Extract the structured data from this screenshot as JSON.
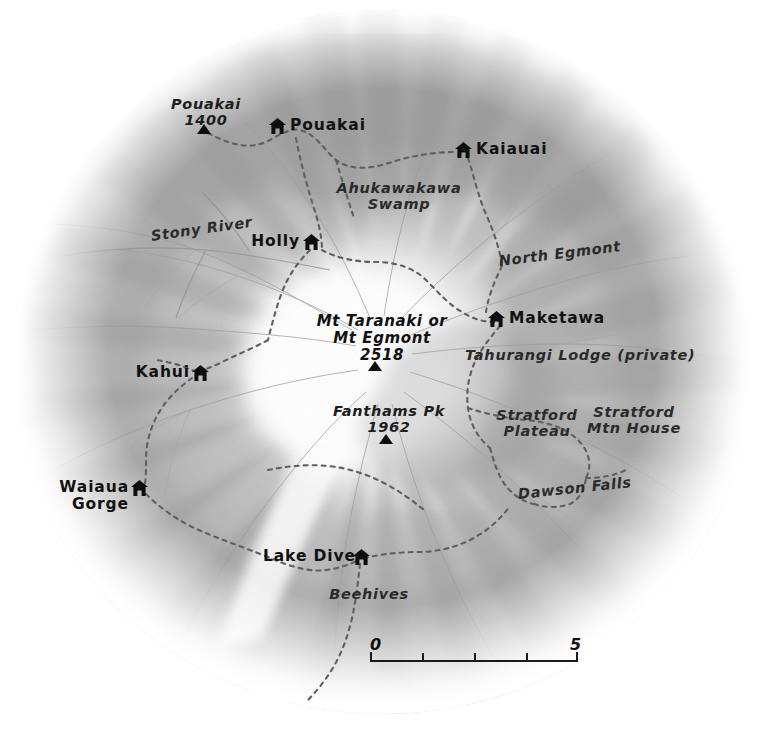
{
  "map": {
    "title": "Egmont National Park / Mt Taranaki shaded relief map",
    "colors": {
      "relief_dark": "#8d8d8d",
      "relief_mid": "#b4b4b4",
      "relief_light": "#dcdcdc",
      "background": "#ffffff",
      "track": "#6b6b6b",
      "stream": "#9a9a9a",
      "label": "#111111",
      "marker": "#0d0d0d"
    },
    "huts": [
      {
        "name": "Pouakai",
        "label_side": "right",
        "x": 277,
        "y": 126,
        "label_x": 295,
        "label_y": 126
      },
      {
        "name": "Kaiauai",
        "label_side": "right",
        "x": 463,
        "y": 150,
        "label_x": 481,
        "label_y": 150
      },
      {
        "name": "Holly",
        "label_side": "left",
        "x": 311,
        "y": 242,
        "label_x": 306,
        "label_y": 242
      },
      {
        "name": "Maketawa",
        "label_side": "right",
        "x": 496,
        "y": 319,
        "label_x": 514,
        "label_y": 319
      },
      {
        "name": "Kahui",
        "label_side": "left",
        "x": 199,
        "y": 373,
        "label_x": 194,
        "label_y": 373
      },
      {
        "name": "Waiaua Gorge",
        "label_side": "left",
        "x": 139,
        "y": 488,
        "label_x": 134,
        "label_y": 481
      },
      {
        "name": "Lake Dive",
        "label_side": "left",
        "x": 360,
        "y": 557,
        "label_x": 356,
        "label_y": 557
      }
    ],
    "summits": [
      {
        "name": "Pouakai",
        "elevation": "1400",
        "x": 204,
        "y": 127,
        "label_x": 206,
        "label_y": 96
      },
      {
        "name": "Mt Taranaki or\nMt Egmont",
        "elevation": "2518",
        "x": 375,
        "y": 364,
        "label_x": 382,
        "label_y": 313
      },
      {
        "name": "Fanthams Pk",
        "elevation": "1962",
        "x": 386,
        "y": 437,
        "label_x": 389,
        "label_y": 404
      }
    ],
    "summit_labels": [
      {
        "lines": [
          "Pouakai",
          "1400"
        ],
        "x": 206,
        "y": 96
      },
      {
        "lines": [
          "Mt Taranaki or",
          "Mt Egmont",
          "2518"
        ],
        "x": 382,
        "y": 313
      },
      {
        "lines": [
          "Fanthams Pk",
          "1962"
        ],
        "x": 389,
        "y": 404
      }
    ],
    "features": [
      {
        "name": "Ahukawakawa\nSwamp",
        "lines": [
          "Ahukawakawa",
          "Swamp"
        ],
        "x": 399,
        "y": 186,
        "align": "center"
      },
      {
        "name": "Stony River",
        "lines": [
          "Stony River"
        ],
        "x": 153,
        "y": 230,
        "align": "left",
        "rotate": -8
      },
      {
        "name": "North Egmont",
        "lines": [
          "North Egmont"
        ],
        "x": 500,
        "y": 256,
        "align": "left",
        "rotate": -7
      },
      {
        "name": "Tahurangi Lodge (private)",
        "lines": [
          "Tahurangi Lodge (private)"
        ],
        "x": 467,
        "y": 348,
        "align": "left",
        "rotate": 0
      },
      {
        "name": "Stratford Plateau",
        "lines": [
          "Stratford",
          "Plateau"
        ],
        "x": 536,
        "y": 412,
        "align": "center",
        "rotate": 0
      },
      {
        "name": "Stratford Mtn House",
        "lines": [
          "Stratford",
          "Mtn House"
        ],
        "x": 632,
        "y": 408,
        "align": "center",
        "rotate": 0
      },
      {
        "name": "Dawson Falls",
        "lines": [
          "Dawson Falls"
        ],
        "x": 519,
        "y": 489,
        "align": "left",
        "rotate": -6
      },
      {
        "name": "Beehives",
        "lines": [
          "Beehives"
        ],
        "x": 369,
        "y": 591,
        "align": "center",
        "rotate": 0
      }
    ],
    "scale_bar": {
      "start_label": "0",
      "end_label": "5",
      "x": 370,
      "y": 646,
      "width": 208,
      "ticks": [
        0.25,
        0.5,
        0.75
      ]
    }
  }
}
